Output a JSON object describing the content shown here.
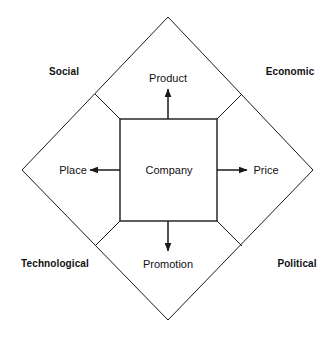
{
  "diagram": {
    "core": {
      "label": "Company"
    },
    "marketing_mix": [
      {
        "id": "product",
        "label": "Product",
        "direction": "up"
      },
      {
        "id": "price",
        "label": "Price",
        "direction": "right"
      },
      {
        "id": "promotion",
        "label": "Promotion",
        "direction": "down"
      },
      {
        "id": "place",
        "label": "Place",
        "direction": "left"
      }
    ],
    "environment": [
      {
        "id": "social",
        "label": "Social",
        "corner": "top-left"
      },
      {
        "id": "economic",
        "label": "Economic",
        "corner": "top-right"
      },
      {
        "id": "technological",
        "label": "Technological",
        "corner": "bottom-left"
      },
      {
        "id": "political",
        "label": "Political",
        "corner": "bottom-right"
      }
    ],
    "colors": {
      "background": "#ffffff",
      "stroke": "#1a1a1a",
      "text": "#111111"
    },
    "geometry": {
      "diamond": {
        "top": [
          168,
          17
        ],
        "right": [
          313,
          170
        ],
        "bottom": [
          168,
          320
        ],
        "left": [
          22,
          170
        ]
      },
      "inner_square": {
        "x": 120,
        "y": 119,
        "width": 97,
        "height": 102
      },
      "connectors": [
        {
          "from": [
            120,
            119
          ],
          "to": [
            95,
            94
          ]
        },
        {
          "from": [
            217,
            119
          ],
          "to": [
            242,
            94
          ]
        },
        {
          "from": [
            217,
            221
          ],
          "to": [
            242,
            246
          ]
        },
        {
          "from": [
            120,
            221
          ],
          "to": [
            95,
            246
          ]
        }
      ],
      "arrows": [
        {
          "id": "product",
          "from": [
            168,
            119
          ],
          "to": [
            168,
            89
          ]
        },
        {
          "id": "price",
          "from": [
            217,
            170
          ],
          "to": [
            247,
            170
          ]
        },
        {
          "id": "promotion",
          "from": [
            168,
            221
          ],
          "to": [
            168,
            251
          ]
        },
        {
          "id": "place",
          "from": [
            120,
            170
          ],
          "to": [
            90,
            170
          ]
        }
      ]
    }
  }
}
